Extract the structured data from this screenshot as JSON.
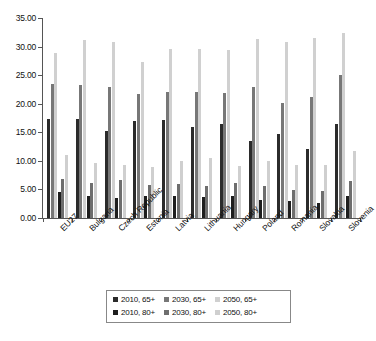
{
  "chart_data": {
    "type": "bar",
    "title": "",
    "subtitle": "",
    "xlabel": "",
    "ylabel": "",
    "ylim": [
      0,
      35
    ],
    "ytick_step": 5,
    "ytick_labels": [
      "0.00",
      "5.00",
      "10.00",
      "15.00",
      "20.00",
      "25.00",
      "30.00",
      "35.00"
    ],
    "grid": false,
    "legend_position": "bottom",
    "categories": [
      "EU27",
      "Bulgaria",
      "Czech Republic",
      "Estonia",
      "Latvia",
      "Lithuania",
      "Hungary",
      "Poland",
      "Romania",
      "Slovakia",
      "Slovenia"
    ],
    "series": [
      {
        "name": "2010, 65+",
        "color": "#2b2b2b",
        "values": [
          17.3,
          17.4,
          15.3,
          16.9,
          17.2,
          15.9,
          16.5,
          13.4,
          14.7,
          12.1,
          16.5
        ]
      },
      {
        "name": "2030, 65+",
        "color": "#777777",
        "values": [
          23.5,
          23.2,
          22.9,
          21.7,
          22.1,
          22.1,
          21.8,
          22.9,
          20.2,
          21.2,
          25.1
        ]
      },
      {
        "name": "2050, 65+",
        "color": "#d0d0d0",
        "values": [
          28.8,
          31.2,
          30.8,
          27.3,
          29.6,
          29.6,
          29.4,
          31.4,
          30.8,
          31.5,
          32.3
        ]
      },
      {
        "name": "2010, 80+",
        "color": "#1e1e1e",
        "values": [
          4.6,
          3.8,
          3.5,
          3.9,
          3.8,
          3.6,
          3.9,
          3.2,
          2.9,
          2.6,
          3.8
        ]
      },
      {
        "name": "2030, 80+",
        "color": "#6e6e6e",
        "values": [
          6.8,
          6.1,
          6.6,
          5.8,
          5.9,
          5.6,
          6.1,
          5.6,
          4.9,
          4.7,
          6.5
        ]
      },
      {
        "name": "2050, 80+",
        "color": "#cfcfcf",
        "values": [
          11.0,
          9.6,
          9.3,
          9.0,
          9.9,
          10.5,
          9.1,
          9.9,
          9.3,
          9.2,
          11.8
        ]
      }
    ]
  },
  "legend": {
    "rows": [
      [
        {
          "label": "2010, 65+",
          "color": "#2b2b2b"
        },
        {
          "label": "2030, 65+",
          "color": "#777777"
        },
        {
          "label": "2050, 65+",
          "color": "#d0d0d0"
        }
      ],
      [
        {
          "label": "2010, 80+",
          "color": "#1e1e1e"
        },
        {
          "label": "2030, 80+",
          "color": "#6e6e6e"
        },
        {
          "label": "2050, 80+",
          "color": "#cfcfcf"
        }
      ]
    ]
  }
}
